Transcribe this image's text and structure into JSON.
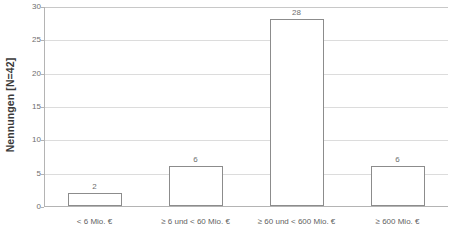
{
  "chart_data": {
    "type": "bar",
    "title": "",
    "xlabel": "",
    "ylabel": "Nennungen [N=42]",
    "categories": [
      "< 6 Mio. €",
      "≥ 6 und < 60 Mio. €",
      "≥ 60 und < 600 Mio. €",
      "≥ 600 Mio. €"
    ],
    "values": [
      2,
      6,
      28,
      6
    ],
    "value_labels": [
      "2",
      "6",
      "28",
      "6"
    ],
    "ylim": [
      0,
      30
    ],
    "yticks": [
      0,
      5,
      10,
      15,
      20,
      25,
      30
    ],
    "ytick_labels": [
      "0",
      "5",
      "10",
      "15",
      "20",
      "25",
      "30"
    ],
    "grid": true,
    "legend": false,
    "bar_fill_color": "#ffffff",
    "bar_border_color": "#8c8c8c",
    "gridline_color": "#dcdcdc",
    "axis_color": "#b4b4b4",
    "text_color": "#6e6e6e"
  }
}
